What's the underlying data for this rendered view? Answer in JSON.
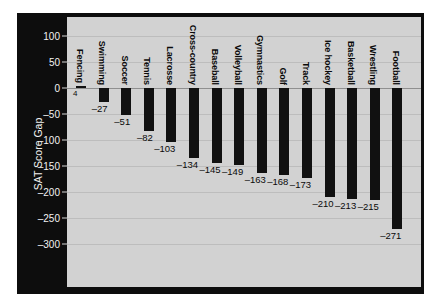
{
  "chart_data": {
    "type": "bar",
    "title": "",
    "xlabel": "",
    "ylabel": "SAT Score Gap",
    "ylim": [
      -325,
      120
    ],
    "yticks": [
      100,
      50,
      0,
      -50,
      -100,
      -150,
      -200,
      -250,
      -300
    ],
    "ytick_labels": [
      "100",
      "50",
      "0",
      "–50",
      "–100",
      "–150",
      "–200",
      "–250",
      "–300"
    ],
    "grid": true,
    "legend": "none",
    "bar_color": "#111111",
    "panel_color": "#d2d2d2",
    "frame_color": "#0d0d0d",
    "categories": [
      "Fencing",
      "Swimming",
      "Soccer",
      "Tennis",
      "Lacrosse",
      "Cross-country",
      "Baseball",
      "Volleyball",
      "Gymnastics",
      "Golf",
      "Track",
      "Ice hockey",
      "Basketball",
      "Wrestling",
      "Football"
    ],
    "values": [
      4,
      -27,
      -51,
      -82,
      -103,
      -134,
      -145,
      -149,
      -163,
      -168,
      -173,
      -210,
      -213,
      -215,
      -271
    ],
    "value_labels": [
      "4",
      "–27",
      "–51",
      "–82",
      "–103",
      "–134",
      "–145",
      "–149",
      "–163",
      "–168",
      "–173",
      "–210",
      "–213",
      "–215",
      "–271"
    ]
  }
}
